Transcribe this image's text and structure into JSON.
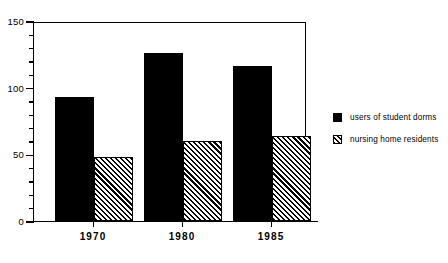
{
  "chart_data": {
    "type": "bar",
    "title": "",
    "subtitle": "",
    "xlabel": "",
    "ylabel": "",
    "categories": [
      "1970",
      "1980",
      "1985"
    ],
    "series": [
      {
        "name": "users of student dorms",
        "values": [
          93,
          126,
          116
        ],
        "style": "solid-black"
      },
      {
        "name": "nursing home residents",
        "values": [
          48,
          60,
          64
        ],
        "style": "diagonal-hatch"
      }
    ],
    "ylim": [
      0,
      150
    ],
    "y_major_ticks": [
      0,
      50,
      100,
      150
    ],
    "y_minor_tick_interval": 10,
    "y_tick_labels": [
      "0",
      "50",
      "100",
      "150"
    ],
    "grid": false,
    "legend_position": "right-outside",
    "frame": true
  },
  "axis": {
    "y_labels": [
      {
        "value": 150,
        "text": "150"
      },
      {
        "value": 100,
        "text": "100"
      },
      {
        "value": 50,
        "text": "50"
      },
      {
        "value": 0,
        "text": "0"
      }
    ],
    "x_labels": [
      {
        "text": "1970"
      },
      {
        "text": "1980"
      },
      {
        "text": "1985"
      }
    ]
  },
  "legend": {
    "items": [
      {
        "label": "users of student dorms",
        "swatch": "solid-black-swatch"
      },
      {
        "label": "nursing home residents",
        "swatch": "hatched-swatch"
      }
    ]
  },
  "colors": {
    "bar_solid": "#000000",
    "bar_hatch_line": "#000000",
    "background": "#ffffff",
    "axis": "#000000"
  }
}
